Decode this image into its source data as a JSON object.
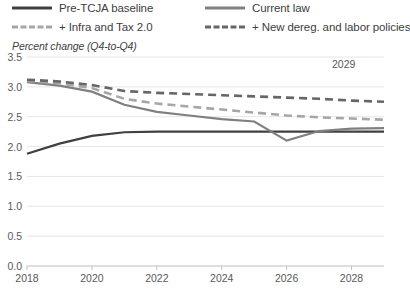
{
  "chart_data": {
    "type": "line",
    "title": "",
    "subtitle": "",
    "ylabel": "Percent change (Q4-to-Q4)",
    "xlabel": "",
    "ylim": [
      0.0,
      3.5
    ],
    "xlim": [
      2018,
      2029
    ],
    "grid": true,
    "legend_position": "top",
    "annotation": "2029",
    "yticks": [
      "0.0",
      "0.5",
      "1.0",
      "1.5",
      "2.0",
      "2.5",
      "3.0",
      "3.5"
    ],
    "ytick_values": [
      0.0,
      0.5,
      1.0,
      1.5,
      2.0,
      2.5,
      3.0,
      3.5
    ],
    "xticks": [
      "2018",
      "2020",
      "2022",
      "2024",
      "2026",
      "2028"
    ],
    "xtick_values": [
      2018,
      2020,
      2022,
      2024,
      2026,
      2028
    ],
    "x": [
      2018,
      2019,
      2020,
      2021,
      2022,
      2023,
      2024,
      2025,
      2026,
      2027,
      2028,
      2029
    ],
    "series": [
      {
        "name": "Pre-TCJA baseline",
        "style": "solid",
        "color": "#404040",
        "width": 2.2,
        "values": [
          1.88,
          2.05,
          2.18,
          2.24,
          2.25,
          2.25,
          2.25,
          2.25,
          2.25,
          2.25,
          2.25,
          2.25
        ]
      },
      {
        "name": "Current law",
        "style": "solid",
        "color": "#808080",
        "width": 2.2,
        "values": [
          3.08,
          3.02,
          2.92,
          2.7,
          2.58,
          2.52,
          2.46,
          2.42,
          2.1,
          2.26,
          2.3,
          2.31
        ]
      },
      {
        "name": "+ Infra and Tax 2.0",
        "style": "dashed",
        "color": "#a6a6a6",
        "width": 2.6,
        "values": [
          3.1,
          3.06,
          2.98,
          2.8,
          2.72,
          2.67,
          2.62,
          2.57,
          2.52,
          2.49,
          2.47,
          2.45
        ]
      },
      {
        "name": "+ New dereg. and labor policies",
        "style": "dashed",
        "color": "#666666",
        "width": 2.6,
        "values": [
          3.12,
          3.09,
          3.03,
          2.93,
          2.9,
          2.88,
          2.86,
          2.84,
          2.82,
          2.8,
          2.77,
          2.75
        ]
      }
    ]
  },
  "legend": {
    "items": [
      {
        "label": "Pre-TCJA baseline",
        "color": "#404040",
        "style": "solid"
      },
      {
        "label": "Current law",
        "color": "#808080",
        "style": "solid"
      },
      {
        "label": "+ Infra and Tax 2.0",
        "color": "#a6a6a6",
        "style": "dashed"
      },
      {
        "label": "+ New dereg. and labor policies",
        "color": "#666666",
        "style": "dashed"
      }
    ]
  },
  "colors": {
    "gridline": "#e6e6e6",
    "axis": "#bfbfbf",
    "tick_text": "#595959",
    "label_text": "#404040",
    "background": "#ffffff"
  }
}
